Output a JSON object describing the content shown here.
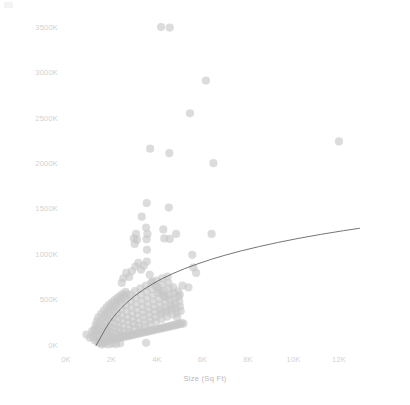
{
  "chart_data": {
    "type": "scatter",
    "title": "",
    "xlabel": "Size (Sq Ft)",
    "ylabel": "Price",
    "grid": false,
    "legend": null,
    "xlim": [
      0,
      13200
    ],
    "ylim": [
      0,
      3700
    ],
    "x_tick_labels": [
      "0K",
      "2K",
      "4K",
      "6K",
      "8K",
      "10K",
      "12K"
    ],
    "x_tick_values": [
      0,
      2000,
      4000,
      6000,
      8000,
      10000,
      12000
    ],
    "y_tick_labels": [
      "0K",
      "500K",
      "1000K",
      "1500K",
      "2000K",
      "2500K",
      "3000K",
      "3500K"
    ],
    "y_tick_values": [
      0,
      500,
      1000,
      1500,
      2000,
      2500,
      3000,
      3500
    ],
    "marker": {
      "shape": "circle",
      "color": "#c6c6c6",
      "opacity": 0.62,
      "radius_px": 4.1
    },
    "trendline": {
      "kind": "logarithmic",
      "color": "#58585c",
      "width_px": 0.9,
      "x_start": 1320,
      "x_end": 12900,
      "points": [
        [
          1320,
          0
        ],
        [
          1500,
          80
        ],
        [
          1700,
          170
        ],
        [
          1900,
          250
        ],
        [
          2100,
          320
        ],
        [
          2400,
          405
        ],
        [
          2700,
          478
        ],
        [
          3000,
          542
        ],
        [
          3400,
          615
        ],
        [
          3800,
          678
        ],
        [
          4200,
          733
        ],
        [
          4700,
          793
        ],
        [
          5200,
          846
        ],
        [
          5800,
          901
        ],
        [
          6400,
          951
        ],
        [
          7000,
          996
        ],
        [
          7700,
          1043
        ],
        [
          8500,
          1091
        ],
        [
          9300,
          1135
        ],
        [
          10200,
          1180
        ],
        [
          11200,
          1225
        ],
        [
          12200,
          1266
        ],
        [
          12900,
          1292
        ]
      ]
    },
    "points": [
      [
        1330,
        140
      ],
      [
        1420,
        95
      ],
      [
        1510,
        60
      ],
      [
        1480,
        185
      ],
      [
        1560,
        120
      ],
      [
        1600,
        210
      ],
      [
        1640,
        150
      ],
      [
        1700,
        95
      ],
      [
        1720,
        255
      ],
      [
        1760,
        180
      ],
      [
        1790,
        120
      ],
      [
        1810,
        300
      ],
      [
        1840,
        215
      ],
      [
        1870,
        160
      ],
      [
        1900,
        105
      ],
      [
        1930,
        340
      ],
      [
        1960,
        265
      ],
      [
        1980,
        195
      ],
      [
        2010,
        140
      ],
      [
        2040,
        90
      ],
      [
        2070,
        390
      ],
      [
        2100,
        310
      ],
      [
        2130,
        245
      ],
      [
        2160,
        185
      ],
      [
        2190,
        135
      ],
      [
        2220,
        440
      ],
      [
        2250,
        355
      ],
      [
        2280,
        290
      ],
      [
        2310,
        225
      ],
      [
        2340,
        170
      ],
      [
        2370,
        120
      ],
      [
        2400,
        480
      ],
      [
        2430,
        400
      ],
      [
        2460,
        330
      ],
      [
        2490,
        270
      ],
      [
        2520,
        210
      ],
      [
        2550,
        160
      ],
      [
        2580,
        115
      ],
      [
        2610,
        520
      ],
      [
        2640,
        445
      ],
      [
        2670,
        375
      ],
      [
        2700,
        310
      ],
      [
        2730,
        255
      ],
      [
        2760,
        200
      ],
      [
        2790,
        150
      ],
      [
        2820,
        560
      ],
      [
        2850,
        485
      ],
      [
        2880,
        415
      ],
      [
        2910,
        350
      ],
      [
        2940,
        290
      ],
      [
        2970,
        235
      ],
      [
        3000,
        185
      ],
      [
        3030,
        600
      ],
      [
        3060,
        525
      ],
      [
        3090,
        455
      ],
      [
        3120,
        390
      ],
      [
        3150,
        330
      ],
      [
        3180,
        275
      ],
      [
        3210,
        220
      ],
      [
        3240,
        175
      ],
      [
        3270,
        630
      ],
      [
        3300,
        560
      ],
      [
        3330,
        490
      ],
      [
        3360,
        425
      ],
      [
        3390,
        365
      ],
      [
        3420,
        310
      ],
      [
        3450,
        255
      ],
      [
        3480,
        205
      ],
      [
        3510,
        660
      ],
      [
        3540,
        590
      ],
      [
        3570,
        520
      ],
      [
        3600,
        455
      ],
      [
        3630,
        395
      ],
      [
        3660,
        340
      ],
      [
        3690,
        285
      ],
      [
        3720,
        235
      ],
      [
        3750,
        690
      ],
      [
        3780,
        620
      ],
      [
        3810,
        550
      ],
      [
        3840,
        485
      ],
      [
        3870,
        425
      ],
      [
        3900,
        370
      ],
      [
        3930,
        315
      ],
      [
        3960,
        265
      ],
      [
        3990,
        715
      ],
      [
        4020,
        645
      ],
      [
        4050,
        578
      ],
      [
        4080,
        512
      ],
      [
        4110,
        452
      ],
      [
        4140,
        396
      ],
      [
        4170,
        342
      ],
      [
        4200,
        292
      ],
      [
        4230,
        740
      ],
      [
        4260,
        670
      ],
      [
        4290,
        602
      ],
      [
        4320,
        538
      ],
      [
        4350,
        478
      ],
      [
        4380,
        422
      ],
      [
        4410,
        368
      ],
      [
        4440,
        318
      ],
      [
        4470,
        760
      ],
      [
        4500,
        692
      ],
      [
        4530,
        625
      ],
      [
        4560,
        562
      ],
      [
        4590,
        502
      ],
      [
        4620,
        446
      ],
      [
        4650,
        392
      ],
      [
        4680,
        342
      ],
      [
        4710,
        640
      ],
      [
        4740,
        578
      ],
      [
        4770,
        518
      ],
      [
        4800,
        462
      ],
      [
        4830,
        408
      ],
      [
        4860,
        358
      ],
      [
        4890,
        310
      ],
      [
        4920,
        598
      ],
      [
        4950,
        540
      ],
      [
        4980,
        484
      ],
      [
        5010,
        430
      ],
      [
        5040,
        380
      ],
      [
        1390,
        45
      ],
      [
        1450,
        32
      ],
      [
        1520,
        28
      ],
      [
        1590,
        42
      ],
      [
        1660,
        38
      ],
      [
        1730,
        55
      ],
      [
        1800,
        48
      ],
      [
        1870,
        62
      ],
      [
        1940,
        58
      ],
      [
        2010,
        70
      ],
      [
        2080,
        66
      ],
      [
        2150,
        78
      ],
      [
        2220,
        74
      ],
      [
        2290,
        86
      ],
      [
        2360,
        82
      ],
      [
        2430,
        94
      ],
      [
        2500,
        90
      ],
      [
        2570,
        102
      ],
      [
        2640,
        98
      ],
      [
        2710,
        110
      ],
      [
        2780,
        106
      ],
      [
        2850,
        118
      ],
      [
        2920,
        114
      ],
      [
        2990,
        126
      ],
      [
        3060,
        122
      ],
      [
        3130,
        134
      ],
      [
        3200,
        130
      ],
      [
        3270,
        142
      ],
      [
        3340,
        138
      ],
      [
        3410,
        150
      ],
      [
        3480,
        146
      ],
      [
        3550,
        158
      ],
      [
        3620,
        154
      ],
      [
        3690,
        166
      ],
      [
        3760,
        162
      ],
      [
        3830,
        174
      ],
      [
        3900,
        170
      ],
      [
        3970,
        182
      ],
      [
        4040,
        178
      ],
      [
        4110,
        190
      ],
      [
        4180,
        186
      ],
      [
        4250,
        198
      ],
      [
        4320,
        194
      ],
      [
        4390,
        206
      ],
      [
        4460,
        202
      ],
      [
        4530,
        214
      ],
      [
        4600,
        210
      ],
      [
        4670,
        222
      ],
      [
        4740,
        218
      ],
      [
        4810,
        230
      ],
      [
        4880,
        226
      ],
      [
        4950,
        238
      ],
      [
        5020,
        234
      ],
      [
        5090,
        246
      ],
      [
        5160,
        242
      ],
      [
        1250,
        175
      ],
      [
        1300,
        225
      ],
      [
        1360,
        270
      ],
      [
        1420,
        310
      ],
      [
        1480,
        245
      ],
      [
        1540,
        350
      ],
      [
        1600,
        290
      ],
      [
        1660,
        385
      ],
      [
        1720,
        330
      ],
      [
        1780,
        420
      ],
      [
        1840,
        365
      ],
      [
        1900,
        450
      ],
      [
        1960,
        400
      ],
      [
        2020,
        475
      ],
      [
        2080,
        430
      ],
      [
        2140,
        500
      ],
      [
        2200,
        460
      ],
      [
        2260,
        525
      ],
      [
        2320,
        490
      ],
      [
        2380,
        548
      ],
      [
        2440,
        515
      ],
      [
        2500,
        570
      ],
      [
        2560,
        540
      ],
      [
        2620,
        592
      ],
      [
        2680,
        562
      ],
      [
        1180,
        90
      ],
      [
        1220,
        130
      ],
      [
        1270,
        55
      ],
      [
        1340,
        195
      ],
      [
        1400,
        160
      ],
      [
        900,
        120
      ],
      [
        1050,
        85
      ],
      [
        1150,
        160
      ],
      [
        2450,
        690
      ],
      [
        2520,
        740
      ],
      [
        2650,
        800
      ],
      [
        2780,
        755
      ],
      [
        2900,
        820
      ],
      [
        3050,
        870
      ],
      [
        3180,
        910
      ],
      [
        3300,
        835
      ],
      [
        3420,
        880
      ],
      [
        3550,
        925
      ],
      [
        3680,
        780
      ],
      [
        3800,
        705
      ],
      [
        3920,
        660
      ],
      [
        4050,
        620
      ],
      [
        4180,
        585
      ],
      [
        4300,
        555
      ],
      [
        4420,
        530
      ],
      [
        2980,
        1180
      ],
      [
        3020,
        1120
      ],
      [
        3080,
        1230
      ],
      [
        3120,
        1165
      ],
      [
        3540,
        1170
      ],
      [
        3580,
        1230
      ],
      [
        3560,
        1055
      ],
      [
        3520,
        1300
      ],
      [
        3330,
        1420
      ],
      [
        3550,
        1570
      ],
      [
        4280,
        1280
      ],
      [
        4320,
        1180
      ],
      [
        4520,
        1520
      ],
      [
        4560,
        1175
      ],
      [
        4840,
        1230
      ],
      [
        4540,
        2120
      ],
      [
        3700,
        2170
      ],
      [
        4180,
        3510
      ],
      [
        4560,
        3505
      ],
      [
        5450,
        2560
      ],
      [
        6150,
        2920
      ],
      [
        6480,
        2010
      ],
      [
        6400,
        1230
      ],
      [
        5550,
        1000
      ],
      [
        5600,
        860
      ],
      [
        5720,
        800
      ],
      [
        5380,
        640
      ],
      [
        5120,
        660
      ],
      [
        5000,
        560
      ],
      [
        4680,
        420
      ],
      [
        4450,
        390
      ],
      [
        4180,
        370
      ],
      [
        12000,
        2250
      ],
      [
        3520,
        30
      ],
      [
        1560,
        10
      ],
      [
        1700,
        18
      ],
      [
        1880,
        12
      ],
      [
        2040,
        22
      ],
      [
        2200,
        15
      ],
      [
        2380,
        25
      ]
    ],
    "estimated_point_count": 260
  }
}
